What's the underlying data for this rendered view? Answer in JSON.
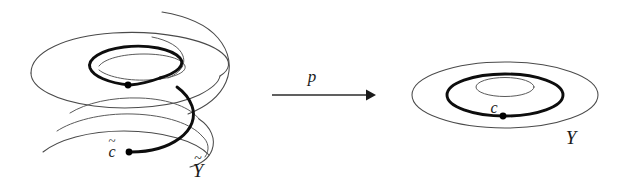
{
  "figure": {
    "caption_present": false,
    "background_color": "#ffffff",
    "ink_color": "#1a1a1a",
    "bold_curve_color": "#0d0d0d",
    "thin_curve_color": "#4a4a4a",
    "width": 629,
    "height": 183
  },
  "left_object": {
    "name": "Y-tilde",
    "label": "Y",
    "label_accent": "~",
    "label_full": "Ỹ",
    "description": "spiral ramp (helicoid) universal cover",
    "path_label": "c",
    "path_label_accent": "~",
    "path_label_full": "c̃",
    "endpoint_marker": "filled-dot"
  },
  "map_arrow": {
    "label": "p",
    "direction": "left-to-right",
    "head": "solid-triangle",
    "x_start": 272,
    "x_end": 373,
    "y": 95
  },
  "right_object": {
    "name": "Y",
    "label": "Y",
    "description": "annulus",
    "loop_label": "c",
    "basepoint_marker": "filled-dot",
    "rings": [
      {
        "role": "outer-boundary",
        "weight": "thin"
      },
      {
        "role": "core-loop",
        "weight": "bold"
      },
      {
        "role": "inner-boundary",
        "weight": "thin"
      }
    ]
  },
  "geometry": {
    "annulus_center_x": 505,
    "annulus_center_y": 95,
    "annulus_outer_rx": 93,
    "annulus_outer_ry": 33,
    "annulus_loop_rx": 58,
    "annulus_loop_ry": 21,
    "annulus_inner_rx": 28,
    "annulus_inner_ry": 9,
    "annulus_dot_x": 503,
    "annulus_dot_y": 116,
    "spiral_dot_upper_x": 128,
    "spiral_dot_upper_y": 85,
    "spiral_dot_lower_x": 129,
    "spiral_dot_lower_y": 152
  },
  "labels": {
    "p_x": 312,
    "p_y": 80,
    "c_x": 495,
    "c_y": 111,
    "Y_x": 571,
    "Y_y": 139,
    "ctilde_x": 112,
    "ctilde_y": 156,
    "Ytilde_x": 198,
    "Ytilde_y": 174
  }
}
